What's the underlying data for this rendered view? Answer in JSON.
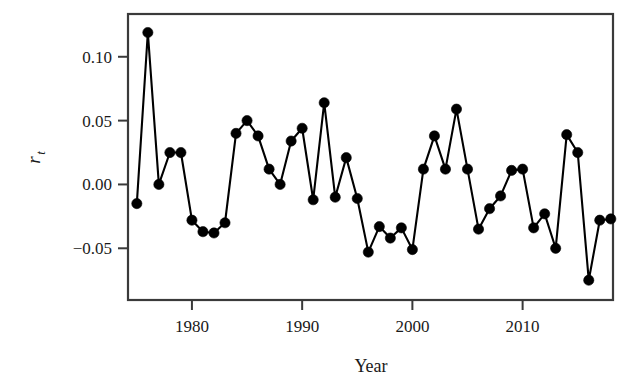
{
  "chart_data": {
    "type": "line",
    "title": "",
    "subtitle": "",
    "xlabel": "Year",
    "ylabel": "r_t",
    "ylabel_base": "r",
    "ylabel_sub": "t",
    "xlim": [
      1974.2,
      2018.2
    ],
    "ylim": [
      -0.0905,
      0.1335
    ],
    "xticks": [
      1980,
      1990,
      2000,
      2010
    ],
    "xticklabels": [
      "1980",
      "1990",
      "2000",
      "2010"
    ],
    "yticks": [
      0.1,
      0.05,
      0.0,
      -0.05
    ],
    "yticklabels": [
      "0.10",
      "0.05",
      "0.00",
      "-0.05"
    ],
    "grid": false,
    "legend": null,
    "marker": "filled-circle",
    "marker_color": "#000000",
    "line_color": "#000000",
    "frame_color": "#3a3a3a",
    "background": "#ffffff",
    "x": [
      1975,
      1976,
      1977,
      1978,
      1979,
      1980,
      1981,
      1982,
      1983,
      1984,
      1985,
      1986,
      1987,
      1988,
      1989,
      1990,
      1991,
      1992,
      1993,
      1994,
      1995,
      1996,
      1997,
      1998,
      1999,
      2000,
      2001,
      2002,
      2003,
      2004,
      2005,
      2006,
      2007,
      2008,
      2009,
      2010,
      2011,
      2012,
      2013,
      2014,
      2015,
      2016,
      2017,
      2018
    ],
    "y": [
      -0.015,
      0.119,
      0.0,
      0.025,
      0.025,
      -0.028,
      -0.037,
      -0.038,
      -0.03,
      0.04,
      0.05,
      0.038,
      0.012,
      0.0,
      0.034,
      0.044,
      -0.012,
      0.064,
      -0.01,
      0.021,
      -0.011,
      -0.053,
      -0.033,
      -0.042,
      -0.034,
      -0.051,
      0.012,
      0.038,
      0.012,
      0.059,
      0.012,
      -0.035,
      -0.019,
      -0.009,
      0.011,
      0.012,
      -0.034,
      -0.023,
      -0.05,
      0.039,
      0.025,
      -0.075,
      -0.028,
      -0.027
    ],
    "series": [
      {
        "name": "r_t",
        "values": [
          -0.015,
          0.119,
          0.0,
          0.025,
          0.025,
          -0.028,
          -0.037,
          -0.038,
          -0.03,
          0.04,
          0.05,
          0.038,
          0.012,
          0.0,
          0.034,
          0.044,
          -0.012,
          0.064,
          -0.01,
          0.021,
          -0.011,
          -0.053,
          -0.033,
          -0.042,
          -0.034,
          -0.051,
          0.012,
          0.038,
          0.012,
          0.059,
          0.012,
          -0.035,
          -0.019,
          -0.009,
          0.011,
          0.012,
          -0.034,
          -0.023,
          -0.05,
          0.039,
          0.025,
          -0.075,
          -0.028,
          -0.027
        ]
      }
    ]
  }
}
